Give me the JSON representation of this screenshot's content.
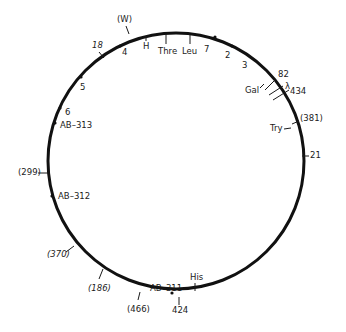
{
  "diagram": {
    "type": "circular-genetic-map",
    "circle": {
      "cx": 176,
      "cy": 161,
      "r": 128,
      "stroke": "#111111",
      "stroke_width": 3
    },
    "markers": [
      {
        "label": "(W)",
        "x": 117,
        "y": 22,
        "italic": false,
        "tick": [
          126,
          26,
          129,
          34
        ]
      },
      {
        "label": "18",
        "x": 92,
        "y": 48,
        "italic": true,
        "tick": [
          99,
          52,
          104,
          58
        ]
      },
      {
        "label": "4",
        "x": 122,
        "y": 55,
        "italic": false,
        "tick": null
      },
      {
        "label": "H",
        "x": 143,
        "y": 49,
        "italic": false,
        "tick": [
          146,
          36,
          146,
          41
        ]
      },
      {
        "label": "Thre",
        "x": 158,
        "y": 54,
        "italic": false,
        "tick": [
          166,
          34,
          166,
          44
        ]
      },
      {
        "label": "Leu",
        "x": 182,
        "y": 54,
        "italic": false,
        "tick": [
          190,
          34,
          190,
          44
        ]
      },
      {
        "label": "7",
        "x": 204,
        "y": 52,
        "italic": false,
        "tick": null
      },
      {
        "label": "2",
        "x": 225,
        "y": 58,
        "italic": false,
        "tick": null
      },
      {
        "label": "3",
        "x": 242,
        "y": 68,
        "italic": false,
        "tick": null
      },
      {
        "label": "82",
        "x": 278,
        "y": 77,
        "italic": false,
        "tick": [
          265,
          90,
          275,
          80
        ]
      },
      {
        "label": "λ",
        "x": 285,
        "y": 89,
        "italic": false,
        "tick": [
          269,
          95,
          283,
          86
        ]
      },
      {
        "label": "434",
        "x": 290,
        "y": 94,
        "italic": false,
        "tick": [
          273,
          100,
          289,
          90
        ]
      },
      {
        "label": "Gal",
        "x": 245,
        "y": 93,
        "italic": false,
        "tick": [
          260,
          88,
          264,
          84
        ]
      },
      {
        "label": "(381)",
        "x": 300,
        "y": 121,
        "italic": false,
        "tick": [
          292,
          124,
          299,
          121
        ]
      },
      {
        "label": "Try",
        "x": 270,
        "y": 131,
        "italic": false,
        "tick": [
          284,
          129,
          291,
          128
        ]
      },
      {
        "label": "21",
        "x": 310,
        "y": 158,
        "italic": false,
        "tick": [
          302,
          156,
          309,
          156
        ]
      },
      {
        "label": "5",
        "x": 80,
        "y": 90,
        "italic": false,
        "tick": null
      },
      {
        "label": "6",
        "x": 65,
        "y": 115,
        "italic": false,
        "tick": null
      },
      {
        "label": "AB–313",
        "x": 60,
        "y": 128,
        "italic": false,
        "tick": null
      },
      {
        "label": "(299)",
        "x": 18,
        "y": 175,
        "italic": false,
        "tick": [
          38,
          173,
          48,
          173
        ]
      },
      {
        "label": "AB–312",
        "x": 58,
        "y": 199,
        "italic": false,
        "tick": null
      },
      {
        "label": "(370)",
        "x": 47,
        "y": 257,
        "italic": true,
        "tick": [
          66,
          252,
          74,
          246
        ]
      },
      {
        "label": "(186)",
        "x": 88,
        "y": 291,
        "italic": true,
        "tick": [
          99,
          279,
          103,
          269
        ]
      },
      {
        "label": "(466)",
        "x": 127,
        "y": 312,
        "italic": false,
        "tick": [
          138,
          300,
          140,
          292
        ]
      },
      {
        "label": "AB–311",
        "x": 150,
        "y": 291,
        "italic": false,
        "tick": null
      },
      {
        "label": "424",
        "x": 172,
        "y": 313,
        "italic": false,
        "tick": [
          179,
          297,
          179,
          305
        ]
      },
      {
        "label": "His",
        "x": 190,
        "y": 280,
        "italic": false,
        "tick": [
          195,
          283,
          195,
          291
        ]
      }
    ],
    "dots": [
      {
        "x": 120,
        "y": 46
      },
      {
        "x": 81,
        "y": 77
      },
      {
        "x": 60,
        "y": 108
      },
      {
        "x": 55,
        "y": 123
      },
      {
        "x": 52,
        "y": 196
      },
      {
        "x": 172,
        "y": 293
      },
      {
        "x": 215,
        "y": 37
      },
      {
        "x": 232,
        "y": 46
      }
    ]
  }
}
